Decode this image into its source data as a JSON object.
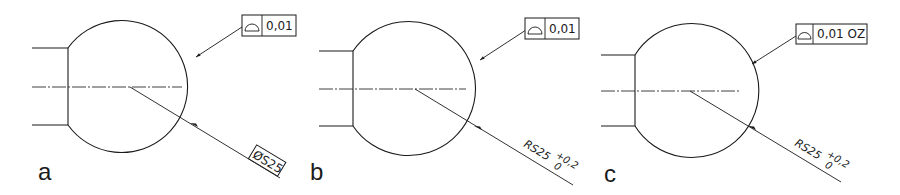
{
  "figure": {
    "panels": [
      {
        "label": "a",
        "fcf_tolerance": "0,01",
        "fcf_symbol": "profile-of-surface",
        "dimension_main": "ØS25",
        "dimension_type": "boxed basic spherical diameter"
      },
      {
        "label": "b",
        "fcf_tolerance": "0,01",
        "fcf_symbol": "profile-of-surface",
        "dimension_main": "RS25",
        "tol_upper": "+0,2",
        "tol_lower": "0"
      },
      {
        "label": "c",
        "fcf_tolerance": "0,01 OZ",
        "fcf_symbol": "profile-of-surface",
        "dimension_main": "RS25",
        "tol_upper": "+0,2",
        "tol_lower": "0"
      }
    ],
    "colors": {
      "line": "#1a1a1a",
      "background": "#ffffff"
    }
  }
}
